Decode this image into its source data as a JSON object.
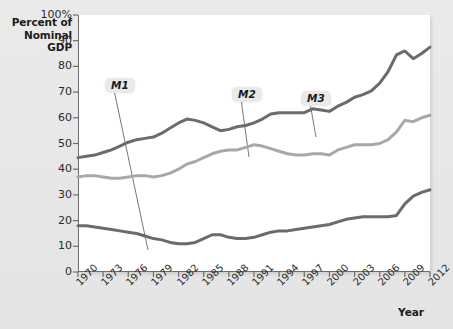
{
  "chart_data": {
    "type": "line",
    "title": "",
    "ylabel": "Percent of\nNominal GDP",
    "xlabel": "Year",
    "ylim": [
      0,
      100
    ],
    "xlim": [
      1970,
      2012
    ],
    "grid": false,
    "legend_position": "inline-callouts",
    "ytick_labels": [
      "100%",
      "90",
      "80",
      "70",
      "60",
      "50",
      "40",
      "30",
      "20",
      "10",
      "0"
    ],
    "ytick_values": [
      100,
      90,
      80,
      70,
      60,
      50,
      40,
      30,
      20,
      10,
      0
    ],
    "xtick_labels": [
      "1970",
      "1973",
      "1976",
      "1979",
      "1982",
      "1985",
      "1988",
      "1991",
      "1994",
      "1997",
      "2000",
      "2003",
      "2006",
      "2009",
      "2012"
    ],
    "xtick_values": [
      1970,
      1973,
      1976,
      1979,
      1982,
      1985,
      1988,
      1991,
      1994,
      1997,
      2000,
      2003,
      2006,
      2009,
      2012
    ],
    "x": [
      1970,
      1971,
      1972,
      1973,
      1974,
      1975,
      1976,
      1977,
      1978,
      1979,
      1980,
      1981,
      1982,
      1983,
      1984,
      1985,
      1986,
      1987,
      1988,
      1989,
      1990,
      1991,
      1992,
      1993,
      1994,
      1995,
      1996,
      1997,
      1998,
      1999,
      2000,
      2001,
      2002,
      2003,
      2004,
      2005,
      2006,
      2007,
      2008,
      2009,
      2010,
      2011,
      2012
    ],
    "series": [
      {
        "name": "M3",
        "color": "#6b6b6b",
        "values": [
          44.5,
          45.0,
          45.5,
          46.5,
          47.5,
          49.0,
          50.5,
          51.5,
          52.0,
          52.5,
          54.0,
          56.0,
          58.0,
          59.5,
          59.0,
          58.0,
          56.5,
          55.0,
          55.5,
          56.5,
          57.0,
          58.0,
          59.5,
          61.5,
          62.0,
          62.0,
          62.0,
          62.0,
          63.5,
          63.0,
          62.5,
          64.5,
          66.0,
          68.0,
          69.0,
          70.5,
          73.5,
          78.0,
          84.5,
          86.0,
          83.0,
          85.0,
          87.5
        ]
      },
      {
        "name": "M2",
        "color": "#a8a8a8",
        "values": [
          37.0,
          37.5,
          37.5,
          37.0,
          36.5,
          36.5,
          37.0,
          37.5,
          37.5,
          37.0,
          37.5,
          38.5,
          40.0,
          42.0,
          43.0,
          44.5,
          46.0,
          47.0,
          47.5,
          47.5,
          48.5,
          49.5,
          49.0,
          48.0,
          47.0,
          46.0,
          45.5,
          45.5,
          46.0,
          46.0,
          45.5,
          47.5,
          48.5,
          49.5,
          49.5,
          49.5,
          50.0,
          51.5,
          54.5,
          59.0,
          58.5,
          60.0,
          61.0
        ]
      },
      {
        "name": "M1",
        "color": "#6b6b6b",
        "values": [
          18.0,
          18.0,
          17.5,
          17.0,
          16.5,
          16.0,
          15.5,
          15.0,
          14.0,
          13.0,
          12.5,
          11.5,
          11.0,
          11.0,
          11.5,
          13.0,
          14.5,
          14.5,
          13.5,
          13.0,
          13.0,
          13.5,
          14.5,
          15.5,
          16.0,
          16.0,
          16.5,
          17.0,
          17.5,
          18.0,
          18.5,
          19.5,
          20.5,
          21.0,
          21.5,
          21.5,
          21.5,
          21.5,
          22.0,
          26.5,
          29.5,
          31.0,
          32.0
        ]
      }
    ],
    "annotations": [
      {
        "label": "M1",
        "label_x": 105,
        "label_y": 78,
        "target_x": 148,
        "target_y": 250
      },
      {
        "label": "M2",
        "label_x": 232,
        "label_y": 87,
        "target_x": 249,
        "target_y": 157
      },
      {
        "label": "M3",
        "label_x": 301,
        "label_y": 91,
        "target_x": 316,
        "target_y": 137
      }
    ]
  }
}
